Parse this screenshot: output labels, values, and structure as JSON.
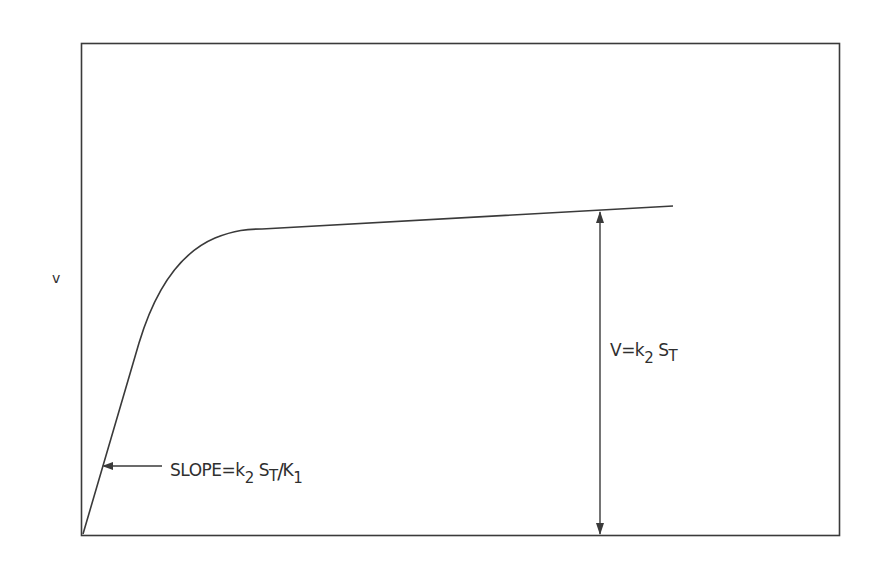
{
  "figure": {
    "y_axis_label": "v",
    "curve_description": "Saturation curve: linear rise from origin, bending into near-plateau",
    "annotations": {
      "max_velocity": {
        "lhs": "V=k",
        "k_sub": "2",
        "s": "S",
        "s_sub": "T"
      },
      "initial_slope": {
        "prefix": "SLOPE=",
        "k": "k",
        "k_sub": "2",
        "s": "S",
        "s_sub": "T",
        "slash": "/",
        "K": "K",
        "K_sub": "1"
      }
    },
    "colors": {
      "ink": "#3a3a3a",
      "background": "#ffffff"
    }
  }
}
